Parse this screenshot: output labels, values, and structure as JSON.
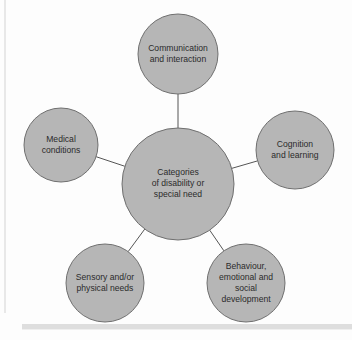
{
  "diagram": {
    "type": "hub-and-spoke",
    "title_text": "Categories of disability or special need",
    "center": {
      "id": "categories-of-disability-or-special-need",
      "lines": [
        "Categories",
        "of disability or",
        "special need"
      ],
      "cx": 178,
      "cy": 184,
      "r": 56
    },
    "nodes": [
      {
        "id": "communication-and-interaction",
        "lines": [
          "Communication",
          "and interaction"
        ],
        "cx": 178,
        "cy": 54,
        "r": 40
      },
      {
        "id": "cognition-and-learning",
        "lines": [
          "Cognition",
          "and learning"
        ],
        "cx": 295,
        "cy": 150,
        "r": 39
      },
      {
        "id": "behaviour-emotional-and-social-development",
        "lines": [
          "Behaviour,",
          "emotional and",
          "social",
          "development"
        ],
        "cx": 246,
        "cy": 283,
        "r": 39
      },
      {
        "id": "sensory-and-or-physical-needs",
        "lines": [
          "Sensory and/or",
          "physical needs"
        ],
        "cx": 105,
        "cy": 283,
        "r": 39
      },
      {
        "id": "medical-conditions",
        "lines": [
          "Medical",
          "conditions"
        ],
        "cx": 61,
        "cy": 145,
        "r": 37
      }
    ],
    "colors": {
      "circle_fill": "#b6b6b6",
      "circle_stroke": "#6f6f6f",
      "connector": "#555555",
      "text": "#2b2b2b",
      "background": "#fdfdfd",
      "frame_rule": "#dedede",
      "frame_vline": "#e8e8e8"
    }
  }
}
